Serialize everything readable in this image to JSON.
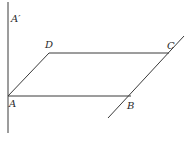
{
  "diagram": {
    "type": "parallelogram-with-axis",
    "points": {
      "A": {
        "label": "A",
        "x": 8,
        "y": 96
      },
      "B": {
        "label": "B",
        "x": 131,
        "y": 96
      },
      "C": {
        "label": "C",
        "x": 169,
        "y": 53
      },
      "D": {
        "label": "D",
        "x": 49,
        "y": 53
      },
      "A_prime": {
        "label": "A′"
      }
    },
    "labels": {
      "a": "A",
      "b": "B",
      "c": "C",
      "d": "D",
      "a_prime": "A′"
    },
    "colors": {
      "line": "#3a3a3a",
      "text": "#2a2a2a",
      "background": "#ffffff"
    }
  }
}
